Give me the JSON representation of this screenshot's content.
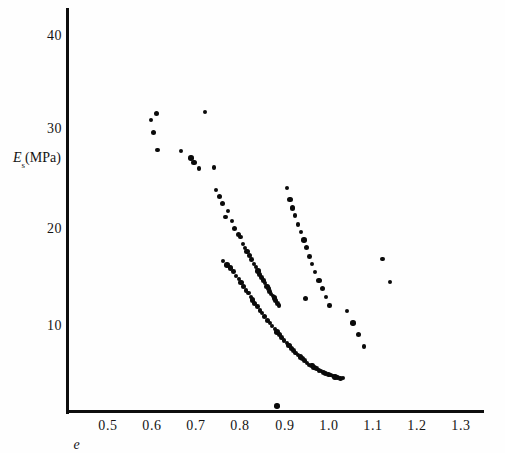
{
  "chart_data": {
    "type": "scatter",
    "title": "",
    "subtitle": "",
    "xlabel": "e",
    "ylabel": "Es(MPa)",
    "ylabel_base": "E",
    "ylabel_sub": "s",
    "ylabel_unit": "(MPa)",
    "xlim": [
      0.44,
      1.38
    ],
    "ylim": [
      0.0,
      42.5
    ],
    "xticks": [
      "0.5",
      "0.6",
      "0.7",
      "0.8",
      "0.9",
      "1.0",
      "1.1",
      "1.2",
      "1.3"
    ],
    "xtick_values": [
      0.5,
      0.6,
      0.7,
      0.8,
      0.9,
      1.0,
      1.1,
      1.2,
      1.3
    ],
    "yticks": [
      "10",
      "20",
      "30",
      "40"
    ],
    "ytick_values": [
      10,
      20,
      30,
      40
    ],
    "grid": false,
    "legend": null,
    "marker": "filled-circle",
    "marker_color": "#0a0a0a",
    "n_points": 113,
    "series": [
      {
        "name": "soil samples",
        "x": [
          0.597,
          0.61,
          0.604,
          0.612,
          0.665,
          0.72,
          0.688,
          0.695,
          0.706,
          0.74,
          0.745,
          0.753,
          0.76,
          0.772,
          0.766,
          0.781,
          0.787,
          0.795,
          0.8,
          0.806,
          0.81,
          0.815,
          0.82,
          0.826,
          0.831,
          0.835,
          0.84,
          0.843,
          0.848,
          0.852,
          0.856,
          0.86,
          0.863,
          0.866,
          0.87,
          0.874,
          0.877,
          0.88,
          0.884,
          0.888,
          0.76,
          0.77,
          0.778,
          0.784,
          0.79,
          0.796,
          0.802,
          0.808,
          0.813,
          0.818,
          0.823,
          0.828,
          0.833,
          0.838,
          0.845,
          0.85,
          0.855,
          0.861,
          0.867,
          0.872,
          0.878,
          0.883,
          0.889,
          0.894,
          0.899,
          0.905,
          0.91,
          0.915,
          0.92,
          0.925,
          0.93,
          0.936,
          0.941,
          0.946,
          0.951,
          0.956,
          0.962,
          0.967,
          0.972,
          0.978,
          0.983,
          0.988,
          0.993,
          0.999,
          1.004,
          1.01,
          1.015,
          1.021,
          1.027,
          1.033,
          0.905,
          0.912,
          0.918,
          0.924,
          0.931,
          0.938,
          0.944,
          0.95,
          0.957,
          0.963,
          0.97,
          0.978,
          0.986,
          0.994,
          1.002,
          1.042,
          1.055,
          1.068,
          1.08,
          1.122,
          1.14,
          0.883,
          0.947
        ],
        "y": [
          31.2,
          31.9,
          29.9,
          28.1,
          28.0,
          32.0,
          27.3,
          26.8,
          26.2,
          26.3,
          24.0,
          23.3,
          22.6,
          21.8,
          21.2,
          20.8,
          20.0,
          19.4,
          19.1,
          18.4,
          18.0,
          17.6,
          17.2,
          16.8,
          16.3,
          16.0,
          15.6,
          15.2,
          14.9,
          14.6,
          14.3,
          14.0,
          13.8,
          13.5,
          13.2,
          13.0,
          12.8,
          12.5,
          12.2,
          12.0,
          16.6,
          16.2,
          15.9,
          15.5,
          15.1,
          14.8,
          14.4,
          14.0,
          13.6,
          13.3,
          12.9,
          12.6,
          12.2,
          11.9,
          11.5,
          11.2,
          10.9,
          10.5,
          10.2,
          9.9,
          9.6,
          9.3,
          9.0,
          8.7,
          8.4,
          8.1,
          7.9,
          7.6,
          7.4,
          7.1,
          6.9,
          6.7,
          6.5,
          6.3,
          6.1,
          5.9,
          5.8,
          5.6,
          5.5,
          5.3,
          5.2,
          5.1,
          5.0,
          4.9,
          4.8,
          4.7,
          4.6,
          4.6,
          4.5,
          4.5,
          24.2,
          23.0,
          22.1,
          21.3,
          20.4,
          19.6,
          18.8,
          18.0,
          17.1,
          16.3,
          15.5,
          14.6,
          13.8,
          12.9,
          12.0,
          11.4,
          10.2,
          9.0,
          7.8,
          16.8,
          14.4,
          1.6,
          12.7
        ]
      }
    ],
    "points": [
      {
        "x": 0.597,
        "y": 31.2
      },
      {
        "x": 0.61,
        "y": 31.9
      },
      {
        "x": 0.604,
        "y": 29.9
      },
      {
        "x": 0.612,
        "y": 28.1
      },
      {
        "x": 0.72,
        "y": 32.0
      },
      {
        "x": 0.688,
        "y": 27.3
      },
      {
        "x": 0.695,
        "y": 26.8
      },
      {
        "x": 0.706,
        "y": 26.2
      },
      {
        "x": 0.74,
        "y": 26.3
      },
      {
        "x": 0.883,
        "y": 1.6
      },
      {
        "x": 1.122,
        "y": 16.8
      },
      {
        "x": 1.14,
        "y": 14.4
      }
    ]
  },
  "axes": {
    "y_axis_name": "vertical-axis-line",
    "x_axis_name": "horizontal-axis-line"
  }
}
